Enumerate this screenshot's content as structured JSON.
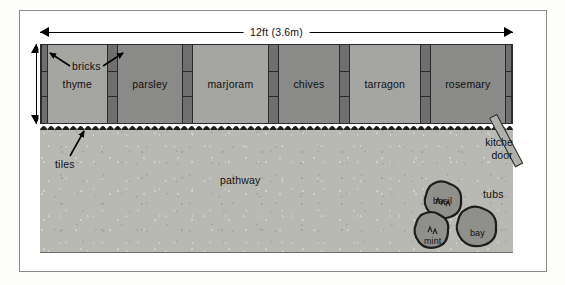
{
  "diagram": {
    "dimensions": {
      "width_label": "12ft (3.6m)",
      "depth_label": "2ft (0.6m)"
    },
    "beds": [
      {
        "label": "thyme",
        "tone": "light"
      },
      {
        "label": "parsley",
        "tone": "dark"
      },
      {
        "label": "marjoram",
        "tone": "light"
      },
      {
        "label": "chives",
        "tone": "dark"
      },
      {
        "label": "tarragon",
        "tone": "light"
      },
      {
        "label": "rosemary",
        "tone": "dark"
      }
    ],
    "callouts": {
      "bricks": "bricks",
      "tiles": "tiles",
      "pathway": "pathway",
      "tubs": "tubs",
      "kitchen_door_line1": "kitchen",
      "kitchen_door_line2": "door"
    },
    "tubs": [
      {
        "label": "basil"
      },
      {
        "label": "bay"
      },
      {
        "label": "mint"
      }
    ],
    "colors": {
      "bed_light": "#a5a5a2",
      "bed_dark": "#8a8a88",
      "brick": "#6f6f6f",
      "pathway": "#b9b9b4",
      "tub": "#8f8f8b",
      "outline": "#2a2a2a",
      "frame": "#8b8b85"
    }
  }
}
